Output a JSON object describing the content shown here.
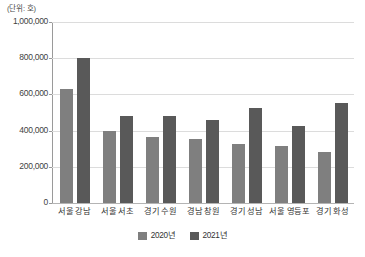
{
  "unit_label": "(단위: 호)",
  "colors": {
    "series_2020": "#7f7f7f",
    "series_2021": "#595959",
    "gridline": "#dcdcdc",
    "axis": "#9a9a9a",
    "text": "#333333",
    "background": "#ffffff"
  },
  "legend": {
    "position": "bottom-center",
    "items": [
      {
        "label": "2020년",
        "color": "#7f7f7f"
      },
      {
        "label": "2021년",
        "color": "#595959"
      }
    ]
  },
  "y_axis": {
    "ticks": [
      "1,000,000",
      "800,000",
      "600,000",
      "400,000",
      "200,000",
      "0"
    ],
    "tick_values": [
      1000000,
      800000,
      600000,
      400000,
      200000,
      0
    ],
    "min": 0,
    "max": 1000000,
    "step": 200000
  },
  "chart_data": {
    "type": "bar",
    "title": "",
    "subtitle": "",
    "xlabel": "",
    "ylabel": "",
    "unit": "(단위: 호)",
    "categories": [
      "서울 강남",
      "서울 서초",
      "경기 수원",
      "경남 창원",
      "경기 성남",
      "서울 영등포",
      "경기 화성"
    ],
    "series": [
      {
        "name": "2020년",
        "color": "#7f7f7f",
        "values": [
          630000,
          398000,
          363000,
          352000,
          328000,
          315000,
          283000
        ]
      },
      {
        "name": "2021년",
        "color": "#595959",
        "values": [
          801000,
          480000,
          480000,
          460000,
          527000,
          428000,
          553000
        ]
      }
    ],
    "ylim": [
      0,
      1000000
    ],
    "ytick_step": 200000,
    "grid": true,
    "legend_position": "bottom"
  }
}
